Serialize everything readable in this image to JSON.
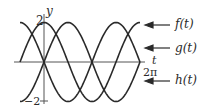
{
  "chart_data": {
    "type": "line",
    "title": "",
    "xlabel": "t",
    "ylabel": "y",
    "xlim": [
      -1.5708,
      6.2832
    ],
    "ylim": [
      -2,
      2
    ],
    "x_ticks": [
      "2π"
    ],
    "y_ticks": [
      "2",
      "−2"
    ],
    "grid": false,
    "legend_position": "right (arrow labels)",
    "series": [
      {
        "name": "f(t)",
        "formula": "2cos(t)",
        "x": [
          -1.5708,
          0,
          1.5708,
          3.1416,
          4.7124,
          6.2832
        ],
        "values": [
          0,
          2,
          0,
          -2,
          0,
          2
        ]
      },
      {
        "name": "g(t)",
        "formula": "-2sin(t)",
        "x": [
          -1.5708,
          0,
          1.5708,
          3.1416,
          4.7124,
          6.2832
        ],
        "values": [
          2,
          0,
          -2,
          0,
          2,
          0
        ]
      },
      {
        "name": "h(t)",
        "formula": "2sin(t)",
        "x": [
          -1.5708,
          0,
          1.5708,
          3.1416,
          4.7124,
          6.2832
        ],
        "values": [
          -2,
          0,
          2,
          0,
          -2,
          0
        ]
      }
    ]
  },
  "axes": {
    "y_label": "y",
    "t_label": "t",
    "y_max_label": "2",
    "y_min_label": "−2",
    "t_max_label": "2π"
  },
  "legend": {
    "f": "f(t)",
    "g": "g(t)",
    "h": "h(t)"
  },
  "colors": {
    "curve": "#2a2a2a",
    "axis": "#555555"
  }
}
